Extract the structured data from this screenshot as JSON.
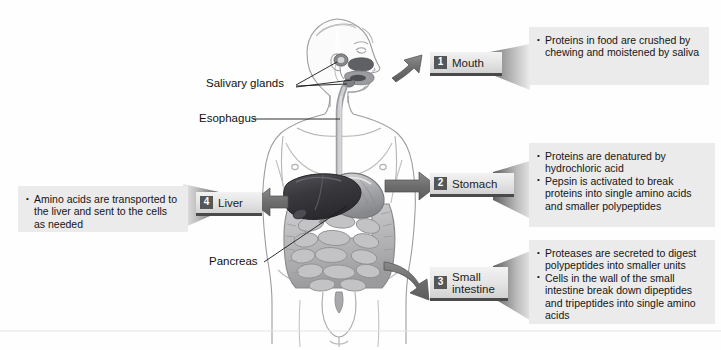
{
  "figure": {
    "background_color": "#ffffff",
    "panel_color": "#ebebeb",
    "tab_color": "#e4e4e4",
    "number_badge_color": "#555658",
    "arrow_color": "#6f6f6f",
    "organ_colors": {
      "liver": "#3c3c3e",
      "stomach": "#8f9093",
      "intestine": "#b8b8ba",
      "body_outline": "#9a9a9a"
    }
  },
  "steps": [
    {
      "number": "1",
      "label": "Mouth",
      "bullets": [
        "Proteins in food are crushed by chewing and moistened by saliva"
      ]
    },
    {
      "number": "2",
      "label": "Stomach",
      "bullets": [
        "Proteins are denatured by hydrochloric acid",
        "Pepsin is activated to break proteins into single amino acids and smaller polypeptides"
      ]
    },
    {
      "number": "3",
      "label": "Small\nintestine",
      "bullets": [
        "Proteases are secreted to digest polypeptides into smaller units",
        "Cells in the wall of the small intestine break down dipeptides and tripeptides into single amino acids"
      ]
    },
    {
      "number": "4",
      "label": "Liver",
      "bullets": [
        "Amino acids are transported to the liver and sent to the cells as needed"
      ]
    }
  ],
  "anatomy_labels": [
    {
      "text": "Salivary glands"
    },
    {
      "text": "Esophagus"
    },
    {
      "text": "Pancreas"
    }
  ]
}
